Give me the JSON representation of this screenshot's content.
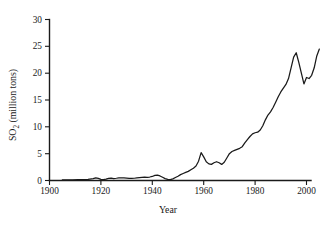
{
  "chart_data": {
    "type": "line",
    "title": "",
    "xlabel": "Year",
    "ylabel": "SO₂ (million tons)",
    "ylabel_main": "SO",
    "ylabel_sub": "2",
    "ylabel_rest": " (million tons)",
    "xlim": [
      1900,
      2006
    ],
    "ylim": [
      0,
      30
    ],
    "grid": false,
    "legend": null,
    "xticks": [
      1900,
      1920,
      1940,
      1960,
      1980,
      2000
    ],
    "xticklabels": [
      "1900",
      "1920",
      "1940",
      "1960",
      "1980",
      "2000"
    ],
    "yticks": [
      0,
      5,
      10,
      15,
      20,
      25,
      30
    ],
    "yticklabels": [
      "0",
      "5",
      "10",
      "15",
      "20",
      "25",
      "30"
    ],
    "line_color": "#1a1a1a",
    "series": [
      {
        "name": "SO2 emissions",
        "x": [
          1905,
          1907,
          1909,
          1911,
          1913,
          1915,
          1917,
          1918,
          1919,
          1920,
          1921,
          1922,
          1923,
          1924,
          1925,
          1926,
          1927,
          1928,
          1929,
          1930,
          1931,
          1932,
          1933,
          1934,
          1935,
          1936,
          1937,
          1938,
          1939,
          1940,
          1941,
          1942,
          1943,
          1944,
          1945,
          1946,
          1947,
          1948,
          1949,
          1950,
          1951,
          1952,
          1953,
          1954,
          1955,
          1956,
          1957,
          1958,
          1959,
          1960,
          1961,
          1962,
          1963,
          1964,
          1965,
          1966,
          1967,
          1968,
          1969,
          1970,
          1971,
          1972,
          1973,
          1974,
          1975,
          1976,
          1977,
          1978,
          1979,
          1980,
          1981,
          1982,
          1983,
          1984,
          1985,
          1986,
          1987,
          1988,
          1989,
          1990,
          1991,
          1992,
          1993,
          1994,
          1995,
          1996,
          1997,
          1998,
          1999,
          2000,
          2001,
          2002,
          2003,
          2004,
          2005
        ],
        "y": [
          0.1,
          0.12,
          0.14,
          0.16,
          0.18,
          0.2,
          0.35,
          0.5,
          0.38,
          0.22,
          0.18,
          0.25,
          0.4,
          0.45,
          0.35,
          0.42,
          0.5,
          0.48,
          0.5,
          0.45,
          0.4,
          0.38,
          0.42,
          0.5,
          0.55,
          0.6,
          0.65,
          0.6,
          0.65,
          0.75,
          0.95,
          1.0,
          0.85,
          0.6,
          0.35,
          0.2,
          0.15,
          0.3,
          0.55,
          0.8,
          1.1,
          1.3,
          1.5,
          1.7,
          2.0,
          2.3,
          2.7,
          3.6,
          5.2,
          4.4,
          3.5,
          3.1,
          3.0,
          3.3,
          3.5,
          3.3,
          3.0,
          3.4,
          4.2,
          5.0,
          5.4,
          5.6,
          5.8,
          6.0,
          6.3,
          7.0,
          7.6,
          8.2,
          8.7,
          8.9,
          9.0,
          9.4,
          10.2,
          11.3,
          12.2,
          12.8,
          13.6,
          14.6,
          15.6,
          16.5,
          17.2,
          17.9,
          19.0,
          21.0,
          23.0,
          23.8,
          22.0,
          20.0,
          18.0,
          19.2,
          19.0,
          19.6,
          21.0,
          23.2,
          24.5
        ]
      }
    ]
  },
  "figure": {
    "background_color": "#ffffff",
    "axis_color": "#1a1a1a"
  }
}
